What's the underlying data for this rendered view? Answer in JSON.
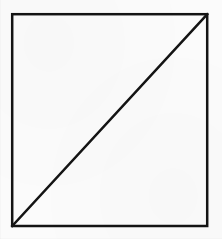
{
  "canvas": {
    "width": 222,
    "height": 239,
    "background_color": "#fbfbfb",
    "paper_tone": "off-white scanned paper"
  },
  "figure": {
    "name": "square-with-diagonal",
    "stroke_color": "#141414",
    "stroke_width": 2.5,
    "fill": "none",
    "shapes": [
      {
        "id": "square",
        "type": "rect",
        "x": 12.2,
        "y": 14.2,
        "width": 195.0,
        "height": 211.8,
        "stroke_color": "#141414",
        "stroke_width": 2.5,
        "fill": "none"
      },
      {
        "id": "diagonal",
        "type": "line",
        "x1": 12.2,
        "y1": 226.0,
        "x2": 207.2,
        "y2": 14.2,
        "stroke_color": "#141414",
        "stroke_width": 2.5,
        "note": "anti-diagonal: bottom-left corner to top-right corner"
      }
    ],
    "corners": {
      "top_left": [
        12.2,
        14.2
      ],
      "top_right": [
        207.2,
        14.2
      ],
      "bottom_right": [
        207.2,
        226.0
      ],
      "bottom_left": [
        12.2,
        226.0
      ]
    },
    "labels": [],
    "text": []
  }
}
